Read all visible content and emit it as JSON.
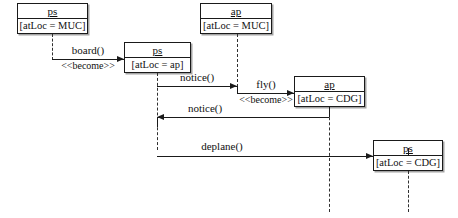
{
  "diagram": {
    "kind": "uml-sequence-diagram",
    "width": 458,
    "height": 218,
    "background": "#ffffff",
    "line_color": "#1a1a1a",
    "text_color": "#111111"
  },
  "objects": [
    {
      "id": "ps-muc",
      "name": "ps",
      "attribute": "[atLoc = MUC]",
      "x": 17,
      "y": 3,
      "w": 71,
      "h": 31,
      "lifeline_x": 52,
      "lifeline_top": 34,
      "lifeline_bottom": 60
    },
    {
      "id": "ps-ap",
      "name": "ps",
      "attribute": "[atLoc = ap]",
      "x": 124,
      "y": 42,
      "w": 67,
      "h": 31,
      "lifeline_x": 157,
      "lifeline_top": 73,
      "lifeline_bottom": 150
    },
    {
      "id": "ap-muc",
      "name": "ap",
      "attribute": "[atLoc = MUC]",
      "x": 200,
      "y": 3,
      "w": 72,
      "h": 31,
      "lifeline_x": 237,
      "lifeline_top": 34,
      "lifeline_bottom": 87
    },
    {
      "id": "ap-cdg",
      "name": "ap",
      "attribute": "[atLoc = CDG]",
      "x": 294,
      "y": 76,
      "w": 71,
      "h": 31,
      "lifeline_x": 329,
      "lifeline_top": 107,
      "lifeline_bottom": 212
    },
    {
      "id": "ps-cdg",
      "name": "ps",
      "attribute": "[atLoc = CDG]",
      "x": 373,
      "y": 140,
      "w": 70,
      "h": 31,
      "lifeline_x": 408,
      "lifeline_top": 171,
      "lifeline_bottom": 212
    }
  ],
  "messages": [
    {
      "id": "board",
      "label": "board()",
      "stereotype": "<<become>>",
      "from_x": 52,
      "to_x": 124,
      "y": 59,
      "direction": "right",
      "label_cx": 88,
      "label_y": 44,
      "stereo_cx": 88,
      "stereo_y": 60
    },
    {
      "id": "notice-1",
      "label": "notice()",
      "stereotype": "",
      "from_x": 157,
      "to_x": 237,
      "y": 86,
      "direction": "right",
      "label_cx": 197,
      "label_y": 71,
      "stereo_cx": 0,
      "stereo_y": 0
    },
    {
      "id": "fly",
      "label": "fly()",
      "stereotype": "<<become>>",
      "from_x": 237,
      "to_x": 294,
      "y": 93,
      "direction": "right",
      "label_cx": 266,
      "label_y": 78,
      "stereo_cx": 266,
      "stereo_y": 94
    },
    {
      "id": "notice-2",
      "label": "notice()",
      "stereotype": "",
      "from_x": 329,
      "to_x": 157,
      "y": 117,
      "direction": "left",
      "label_cx": 205,
      "label_y": 102,
      "stereo_cx": 0,
      "stereo_y": 0
    },
    {
      "id": "deplane",
      "label": "deplane()",
      "stereotype": "",
      "from_x": 157,
      "to_x": 373,
      "y": 156,
      "direction": "right",
      "label_cx": 222,
      "label_y": 140,
      "stereo_cx": 0,
      "stereo_y": 0
    }
  ],
  "connectors": {
    "notice1_drop": {
      "x": 237,
      "y_top": 86,
      "y_bottom": 93
    },
    "notice2_drop": {
      "x": 329,
      "y_top": 107,
      "y_bottom": 117
    },
    "notice2_end": {
      "x": 157,
      "y_top": 117,
      "y_bottom": 127
    },
    "deplane_end": {
      "x": 408,
      "y_top": 148,
      "y_bottom": 156
    }
  }
}
